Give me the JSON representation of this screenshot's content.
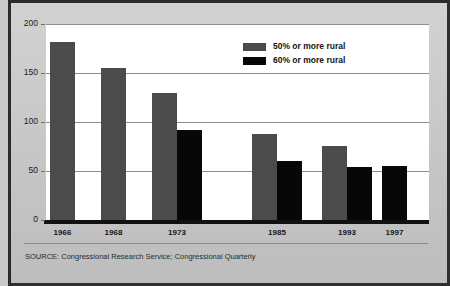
{
  "chart_data": {
    "type": "bar",
    "title": "",
    "xlabel": "",
    "ylabel": "",
    "ylim": [
      0,
      200
    ],
    "yticks": [
      0,
      50,
      100,
      150,
      200
    ],
    "grid": true,
    "legend_position": "top-center-right",
    "categories": [
      "1966",
      "1968",
      "1973",
      "1985",
      "1993",
      "1997"
    ],
    "series": [
      {
        "name": "50% or more rural",
        "color": "#4b4b4b",
        "values": [
          182,
          155,
          130,
          88,
          76,
          null
        ]
      },
      {
        "name": "60% or more rural",
        "color": "#070707",
        "values": [
          null,
          null,
          92,
          60,
          54,
          55
        ]
      }
    ],
    "source": "SOURCE: Congressional Research Service; Congressional Quarterly"
  },
  "legend": {
    "items": [
      {
        "label": "50% or more rural",
        "color": "#4b4b4b"
      },
      {
        "label": "60% or more rural",
        "color": "#070707"
      }
    ]
  },
  "axis": {
    "y_labels": [
      "200",
      "150",
      "100",
      "50",
      "0"
    ],
    "x_labels": [
      "1966",
      "1968",
      "1973",
      "1985",
      "1993",
      "1997"
    ]
  },
  "footer": {
    "source": "SOURCE: Congressional Research Service; Congressional Quarterly"
  }
}
